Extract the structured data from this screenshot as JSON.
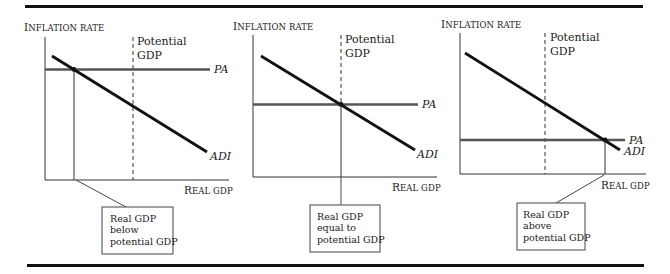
{
  "figure": {
    "colors": {
      "ink": "#111111",
      "pa_line": "#555555",
      "axis": "#333333",
      "box_border": "#444444",
      "background": "#ffffff"
    }
  },
  "panels": [
    {
      "id": "below",
      "y_axis_title_cap": "I",
      "y_axis_title_rest": "NFLATION RATE",
      "x_axis_title_cap": "R",
      "x_axis_title_rest": "EAL GDP",
      "potential_label_line1": "Potential",
      "potential_label_line2": "GDP",
      "pa_label": "PA",
      "adi_label": "ADI",
      "callout_line1": "Real GDP",
      "callout_line2": "below",
      "callout_line3": "potential GDP"
    },
    {
      "id": "equal",
      "y_axis_title_cap": "I",
      "y_axis_title_rest": "NFLATION RATE",
      "x_axis_title_cap": "R",
      "x_axis_title_rest": "EAL GDP",
      "potential_label_line1": "Potential",
      "potential_label_line2": "GDP",
      "pa_label": "PA",
      "adi_label": "ADI",
      "callout_line1": "Real GDP",
      "callout_line2": "equal to",
      "callout_line3": "potential GDP"
    },
    {
      "id": "above",
      "y_axis_title_cap": "I",
      "y_axis_title_rest": "NFLATION RATE",
      "x_axis_title_cap": "R",
      "x_axis_title_rest": "EAL GDP",
      "potential_label_line1": "Potential",
      "potential_label_line2": "GDP",
      "pa_label": "PA",
      "adi_label": "ADI",
      "callout_line1": "Real GDP",
      "callout_line2": "above",
      "callout_line3": "potential GDP"
    }
  ]
}
